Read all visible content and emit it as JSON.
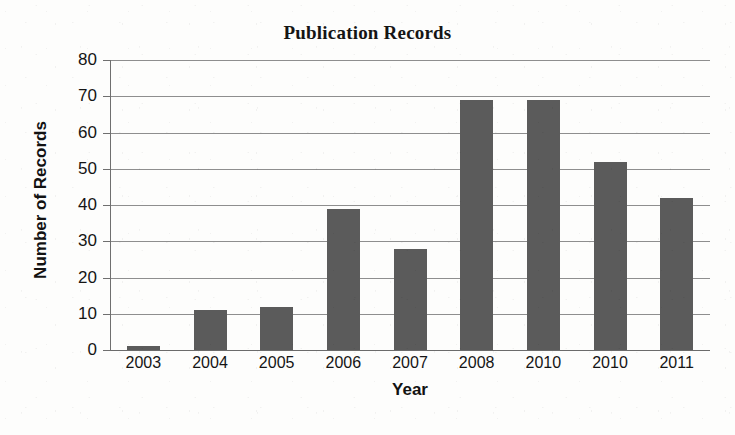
{
  "chart_data": {
    "type": "bar",
    "title": "Publication Records",
    "xlabel": "Year",
    "ylabel": "Number of Records",
    "categories": [
      "2003",
      "2004",
      "2005",
      "2006",
      "2007",
      "2008",
      "2010",
      "2010",
      "2011"
    ],
    "values": [
      1,
      11,
      12,
      39,
      28,
      69,
      69,
      52,
      42
    ],
    "ylim": [
      0,
      80
    ],
    "yticks": [
      0,
      10,
      20,
      30,
      40,
      50,
      60,
      70,
      80
    ],
    "ytick_labels": [
      "0",
      "10",
      "20",
      "30",
      "40",
      "50",
      "60",
      "70",
      "80"
    ],
    "grid": true,
    "grid_axis": "y",
    "legend": false,
    "series": [
      {
        "name": "Number of Records",
        "values": [
          1,
          11,
          12,
          39,
          28,
          69,
          69,
          52,
          42
        ],
        "color": "#5b5b5b"
      }
    ],
    "bar_color": "#5b5b5b",
    "background_color": "#fdfdfc",
    "gridline_color": "#8e8e8e",
    "axis_color": "#6f6f6f"
  }
}
